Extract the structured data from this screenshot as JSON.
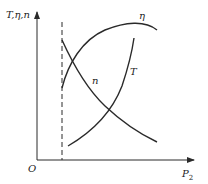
{
  "diagram": {
    "type": "characteristic-curves",
    "axes": {
      "y_label": "T,η,n",
      "x_label_main": "P",
      "x_label_sub": "2",
      "origin_label": "O"
    },
    "curves": [
      {
        "id": "n",
        "label": "n",
        "trend": "decreasing"
      },
      {
        "id": "eta",
        "label": "η",
        "trend": "rising then flattening"
      },
      {
        "id": "T",
        "label": "T",
        "trend": "increasing"
      }
    ],
    "reference_line": {
      "style": "dashed",
      "orientation": "vertical"
    },
    "colors": {
      "line": "#2a2a2a",
      "background": "#ffffff"
    }
  }
}
